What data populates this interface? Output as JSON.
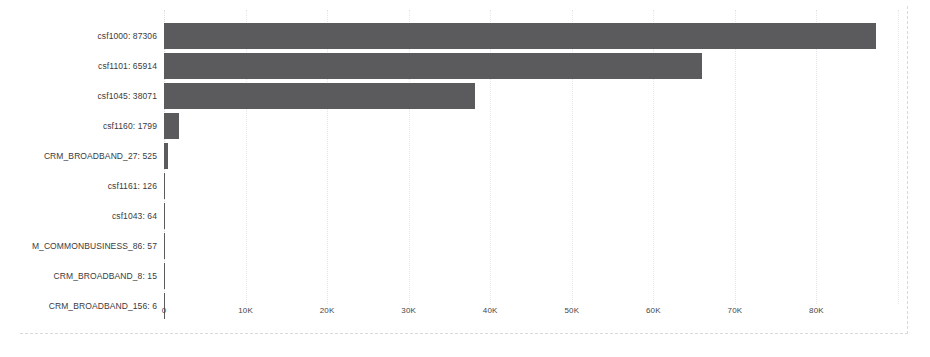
{
  "chart_data": {
    "type": "bar",
    "orientation": "horizontal",
    "title": "",
    "subtitle": "",
    "xlabel": "",
    "ylabel": "",
    "categories": [
      "csf1000",
      "csf1101",
      "csf1045",
      "csf1160",
      "CRM_BROADBAND_27",
      "csf1161",
      "csf1043",
      "M_COMMONBUSINESS_86",
      "CRM_BROADBAND_8",
      "CRM_BROADBAND_156"
    ],
    "values": [
      87306,
      65914,
      38071,
      1799,
      525,
      126,
      64,
      57,
      15,
      6
    ],
    "category_labels": [
      "csf1000: 87306",
      "csf1101: 65914",
      "csf1045: 38071",
      "csf1160: 1799",
      "CRM_BROADBAND_27: 525",
      "csf1161: 126",
      "csf1043: 64",
      "M_COMMONBUSINESS_86: 57",
      "CRM_BROADBAND_8: 15",
      "CRM_BROADBAND_156: 6"
    ],
    "xlim": [
      0,
      93000
    ],
    "xticks": [
      0,
      10000,
      20000,
      30000,
      40000,
      50000,
      60000,
      70000,
      80000
    ],
    "xtick_labels": [
      "0",
      "10K",
      "20K",
      "30K",
      "40K",
      "50K",
      "60K",
      "70K",
      "80K"
    ],
    "grid": true,
    "grid_axis": "x",
    "legend": false,
    "legend_position": "none",
    "colors": {
      "bar": "#5b5b5d",
      "grid": "#e6e6ea",
      "border": "#d8d8dd",
      "text": "#3a3a3e",
      "background": "#ffffff"
    }
  }
}
